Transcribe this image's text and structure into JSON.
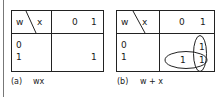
{
  "maps": [
    {
      "row_var": "w",
      "col_var": "x",
      "col_headers": [
        "0",
        "1"
      ],
      "row_headers": [
        "0",
        "1"
      ],
      "cells": [
        [
          "",
          ""
        ],
        [
          "",
          "1"
        ]
      ],
      "caption_label": "(a)",
      "caption_expr": "wx"
    },
    {
      "row_var": "w",
      "col_var": "x",
      "col_headers": [
        "0",
        "1"
      ],
      "row_headers": [
        "0",
        "1"
      ],
      "cells": [
        [
          "",
          "1"
        ],
        [
          "1",
          "1"
        ]
      ],
      "caption_label": "(b)",
      "caption_expr": "w + x",
      "groups": [
        "column x=1",
        "row w=1"
      ]
    }
  ]
}
